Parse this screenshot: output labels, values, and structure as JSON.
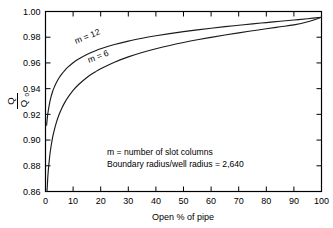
{
  "chart_data": {
    "type": "line",
    "title": "",
    "xlabel": "Open % of pipe",
    "ylabel": "Q/Qo",
    "ylabel_numerator": "Q",
    "ylabel_denominator": "Q",
    "ylabel_denominator_sub": "o",
    "xlim": [
      0,
      100
    ],
    "ylim": [
      0.86,
      1.0
    ],
    "grid": false,
    "legend_position": "inline-curve-labels",
    "xticks": [
      0,
      10,
      20,
      30,
      40,
      50,
      60,
      70,
      80,
      90,
      100
    ],
    "xtick_labels": [
      "0",
      "10",
      "20",
      "30",
      "40",
      "50",
      "60",
      "70",
      "80",
      "90",
      "100"
    ],
    "yticks": [
      0.86,
      0.88,
      0.9,
      0.92,
      0.94,
      0.96,
      0.98,
      1.0
    ],
    "ytick_labels": [
      "0.86",
      "0.88",
      "0.90",
      "0.92",
      "0.94",
      "0.96",
      "0.98",
      "1.00"
    ],
    "series": [
      {
        "name": "m = 12",
        "label": "m = 12",
        "color": "#1a1a1a",
        "x": [
          0.4,
          0.7,
          1.0,
          1.5,
          2.0,
          2.5,
          3.0,
          4.0,
          5.0,
          6.0,
          7.0,
          8.0,
          10.0,
          12.0,
          15.0,
          18.0,
          20.0,
          25.0,
          30.0,
          35.0,
          40.0,
          45.0,
          50.0,
          55.0,
          60.0,
          65.0,
          70.0,
          75.0,
          80.0,
          85.0,
          90.0,
          95.0,
          100.0
        ],
        "y": [
          0.9115,
          0.918,
          0.9228,
          0.929,
          0.9336,
          0.9372,
          0.9402,
          0.945,
          0.9487,
          0.9517,
          0.9543,
          0.9565,
          0.9602,
          0.9631,
          0.9666,
          0.9694,
          0.971,
          0.9743,
          0.977,
          0.9792,
          0.9811,
          0.9828,
          0.9843,
          0.9857,
          0.987,
          0.9882,
          0.9893,
          0.9904,
          0.9914,
          0.9924,
          0.9934,
          0.9944,
          0.9955
        ]
      },
      {
        "name": "m = 6",
        "label": "m = 6",
        "color": "#1a1a1a",
        "x": [
          0.55,
          0.8,
          1.0,
          1.5,
          2.0,
          2.5,
          3.0,
          4.0,
          5.0,
          6.0,
          7.0,
          8.0,
          10.0,
          12.0,
          15.0,
          18.0,
          20.0,
          25.0,
          30.0,
          35.0,
          40.0,
          45.0,
          50.0,
          55.0,
          60.0,
          65.0,
          70.0,
          75.0,
          80.0,
          85.0,
          90.0,
          95.0,
          100.0
        ],
        "y": [
          0.86,
          0.87,
          0.876,
          0.887,
          0.895,
          0.9012,
          0.9062,
          0.9142,
          0.9203,
          0.9252,
          0.9293,
          0.9328,
          0.9386,
          0.9432,
          0.9487,
          0.953,
          0.9555,
          0.9606,
          0.9647,
          0.9681,
          0.971,
          0.9736,
          0.9759,
          0.978,
          0.9799,
          0.9817,
          0.9834,
          0.985,
          0.9866,
          0.9881,
          0.9896,
          0.992,
          0.9955
        ]
      }
    ],
    "annotations": [
      "m = number of slot columns",
      "Boundary radius/well radius = 2,640"
    ]
  }
}
